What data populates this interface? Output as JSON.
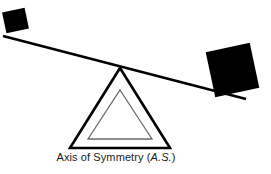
{
  "figure": {
    "background_color": "#ffffff",
    "stroke_color": "#000000",
    "inner_triangle_color": "#6b6b6b",
    "block_color": "#000000",
    "text_color": "#1a1a1a"
  },
  "caption": {
    "text_main": "Axis of Symmetry (",
    "text_italic": "A.S.",
    "text_close": ")",
    "full_text": "Axis of Symmetry (A.S.)"
  },
  "elements": {
    "lever_label": "lever-beam",
    "fulcrum_label": "fulcrum-triangle",
    "inner_fulcrum_label": "fulcrum-inner-triangle",
    "left_block_label": "small-black-square",
    "right_block_label": "large-black-square"
  },
  "geometry": {
    "lever": {
      "x1": 3,
      "y1": 36,
      "x2": 246,
      "y2": 99,
      "stroke_width": 2.6
    },
    "fulcrum_outer": {
      "apex_x": 120,
      "apex_y": 68,
      "base_left_x": 70,
      "base_right_x": 170,
      "base_y": 148,
      "stroke_width": 2.6
    },
    "fulcrum_inner": {
      "apex_x": 120,
      "apex_y": 90,
      "base_left_x": 88,
      "base_right_x": 152,
      "base_y": 139,
      "stroke_width": 1.3
    },
    "left_square": {
      "x": 4,
      "y": 10,
      "width": 23,
      "height": 21,
      "rotation_deg": -12
    },
    "right_square": {
      "x": 210,
      "y": 47,
      "width": 45,
      "height": 46,
      "rotation_deg": -12
    }
  }
}
